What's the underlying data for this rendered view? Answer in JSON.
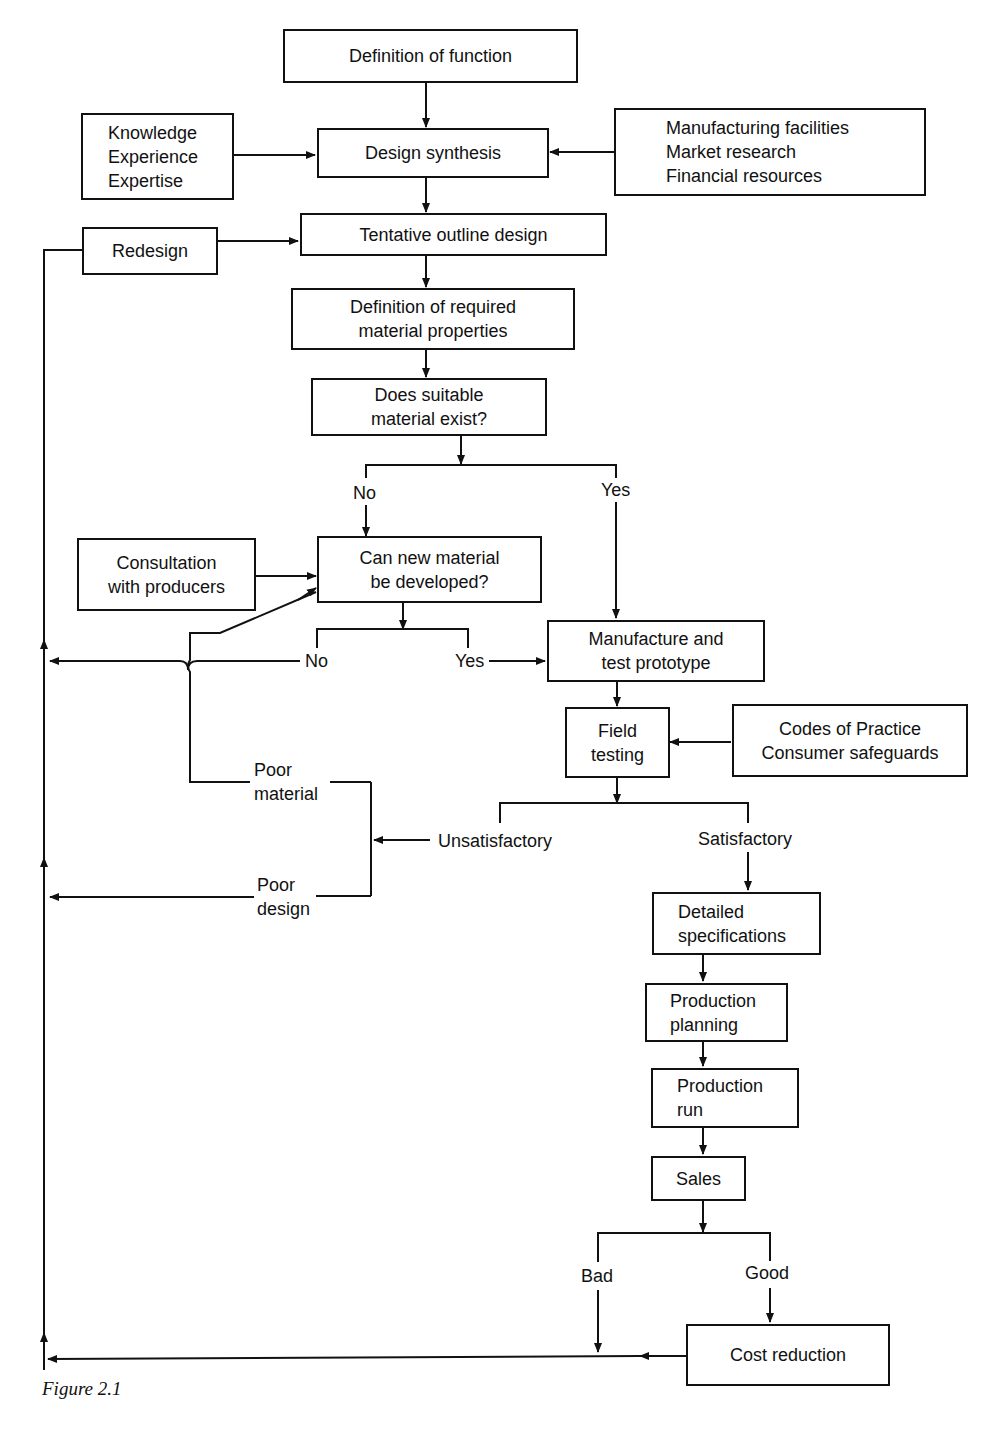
{
  "nodes": {
    "definition_of_function": [
      "Definition of function"
    ],
    "knowledge": [
      "Knowledge",
      "Experience",
      "Expertise"
    ],
    "design_synthesis": [
      "Design synthesis"
    ],
    "resources": [
      "Manufacturing facilities",
      "Market research",
      "Financial resources"
    ],
    "redesign": [
      "Redesign"
    ],
    "tentative_outline_design": [
      "Tentative outline design"
    ],
    "required_properties": [
      "Definition of required",
      "material properties"
    ],
    "suitable_material": [
      "Does suitable",
      "material exist?"
    ],
    "consultation": [
      "Consultation",
      "with producers"
    ],
    "new_material": [
      "Can new material",
      "be developed?"
    ],
    "manufacture_prototype": [
      "Manufacture and",
      "test prototype"
    ],
    "field_testing": [
      "Field",
      "testing"
    ],
    "codes_of_practice": [
      "Codes of Practice",
      "Consumer safeguards"
    ],
    "detailed_specifications": [
      "Detailed",
      "specifications"
    ],
    "production_planning": [
      "Production",
      "planning"
    ],
    "production_run": [
      "Production",
      "run"
    ],
    "sales": [
      "Sales"
    ],
    "cost_reduction": [
      "Cost reduction"
    ]
  },
  "labels": {
    "no_1": "No",
    "yes_1": "Yes",
    "no_2": "No",
    "yes_2": "Yes",
    "poor_material": [
      "Poor",
      "material"
    ],
    "unsatisfactory": "Unsatisfactory",
    "satisfactory": "Satisfactory",
    "poor_design": [
      "Poor",
      "design"
    ],
    "bad": "Bad",
    "good": "Good"
  },
  "caption": "Figure 2.1"
}
